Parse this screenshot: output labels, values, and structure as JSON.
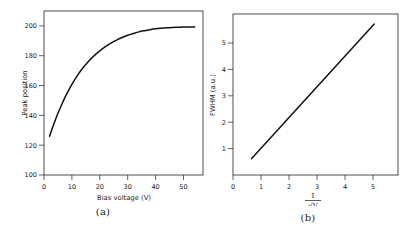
{
  "figure": {
    "background_color": "#ffffff",
    "line_color": "#111111",
    "axis_color": "#3a3a3a"
  },
  "panels": [
    {
      "caption": "(a)",
      "chart_data": {
        "type": "line",
        "title": "",
        "xlabel": "Bias voltage (V)",
        "ylabel": "Peak position",
        "xlim": [
          0,
          57
        ],
        "ylim": [
          100,
          210
        ],
        "xticks": [
          0,
          10,
          20,
          30,
          40,
          50
        ],
        "yticks": [
          100,
          120,
          140,
          160,
          180,
          200
        ],
        "xtick_labels": [
          "0",
          "10",
          "20",
          "30",
          "40",
          "50"
        ],
        "ytick_labels": [
          "100",
          "120",
          "140",
          "160",
          "180",
          "200"
        ],
        "grid": false,
        "legend": "none",
        "series": [
          {
            "name": "Peak position vs bias voltage",
            "x": [
              2,
              3,
              4,
              5,
              6,
              8,
              10,
              12,
              14,
              16,
              18,
              20,
              22,
              24,
              26,
              28,
              30,
              32,
              34,
              36,
              38,
              40,
              42,
              44,
              46,
              48,
              50,
              52,
              54
            ],
            "y": [
              126.0,
              131.5,
              136.6,
              141.4,
              145.8,
              153.9,
              160.8,
              166.8,
              171.9,
              176.3,
              180.1,
              183.3,
              186.1,
              188.5,
              190.5,
              192.2,
              193.7,
              194.9,
              196.0,
              196.8,
              197.5,
              198.1,
              198.5,
              198.8,
              199.0,
              199.1,
              199.2,
              199.3,
              199.3
            ]
          }
        ]
      }
    },
    {
      "caption": "(b)",
      "chart_data": {
        "type": "line",
        "title": "",
        "xlabel_numerator": "1",
        "xlabel_denominator": "√V",
        "ylabel": "FWHM (a.u.)",
        "xlim": [
          0,
          5.9
        ],
        "ylim": [
          0,
          6.1
        ],
        "xticks": [
          0,
          1,
          2,
          3,
          4,
          5
        ],
        "yticks": [
          1,
          2,
          3,
          4,
          5
        ],
        "xtick_labels": [
          "0",
          "1",
          "2",
          "3",
          "4",
          "5"
        ],
        "ytick_labels": [
          "1",
          "2",
          "3",
          "4",
          "5"
        ],
        "grid": false,
        "legend": "none",
        "series": [
          {
            "name": "FWHM vs inverse square-root voltage",
            "x": [
              0.66,
              5.05
            ],
            "y": [
              0.62,
              5.72
            ]
          }
        ]
      }
    }
  ]
}
